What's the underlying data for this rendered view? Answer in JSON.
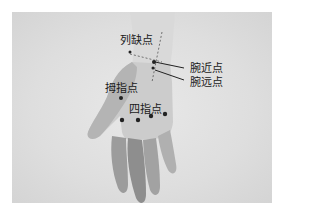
{
  "figure": {
    "labels": {
      "lieque": "列缺点",
      "wan_jin": "腕近点",
      "wan_yuan": "腕远点",
      "muzhi": "拇指点",
      "sizhi": "四指点"
    }
  }
}
